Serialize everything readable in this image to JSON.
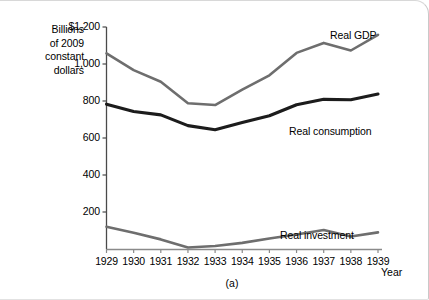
{
  "figure": {
    "caption": "(a)",
    "y_axis_title": [
      "Billions",
      "of 2009",
      "constant",
      "dollars"
    ],
    "x_axis_name": "Year"
  },
  "chart_data": {
    "type": "line",
    "title": "",
    "subtitle": "",
    "xlabel": "Year",
    "ylabel": "Billions of 2009 constant dollars",
    "categories": [
      1929,
      1930,
      1931,
      1932,
      1933,
      1934,
      1935,
      1936,
      1937,
      1938,
      1939
    ],
    "xtick_labels": [
      "1929",
      "1930",
      "1931",
      "1932",
      "1933",
      "1934",
      "1935",
      "1936",
      "1937",
      "1938",
      "1939"
    ],
    "ytick_labels": [
      "$1,200",
      "1,000",
      "800",
      "600",
      "400",
      "200"
    ],
    "ytick_values": [
      1200,
      1000,
      800,
      600,
      400,
      200
    ],
    "ylim": [
      0,
      1200
    ],
    "xlim": [
      1929,
      1939
    ],
    "grid": false,
    "legend_position": "inline-end-of-line",
    "series": [
      {
        "name": "Real GDP",
        "color": "#6e6e6e",
        "width": 2.6,
        "label_anchor": {
          "x": 330,
          "y": 28
        },
        "values": [
          1057,
          967,
          904,
          788,
          778,
          862,
          939,
          1060,
          1114,
          1073,
          1158
        ]
      },
      {
        "name": "Real consumption",
        "color": "#1c1c1c",
        "width": 3.1,
        "label_anchor": {
          "x": 289,
          "y": 124
        },
        "values": [
          783,
          743,
          725,
          667,
          645,
          684,
          720,
          780,
          809,
          807,
          838
        ]
      },
      {
        "name": "Real investment",
        "color": "#6e6e6e",
        "width": 2.6,
        "label_anchor": {
          "x": 280,
          "y": 228
        },
        "values": [
          120,
          88,
          52,
          8,
          16,
          33,
          57,
          78,
          103,
          68,
          90
        ]
      }
    ]
  }
}
